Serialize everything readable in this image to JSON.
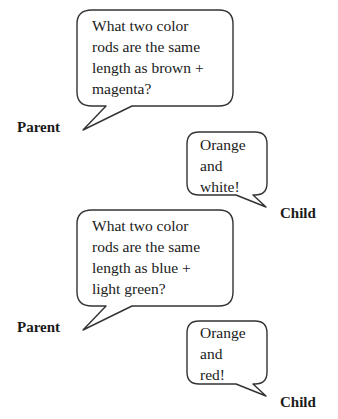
{
  "dialogue": [
    {
      "speaker": "Parent",
      "text": "What two color\nrods are the same\nlength as brown +\nmagenta?"
    },
    {
      "speaker": "Child",
      "text": "Orange\nand\nwhite!"
    },
    {
      "speaker": "Parent",
      "text": "What two color\nrods are the same\nlength as blue +\nlight green?"
    },
    {
      "speaker": "Child",
      "text": "Orange\nand\nred!"
    }
  ]
}
